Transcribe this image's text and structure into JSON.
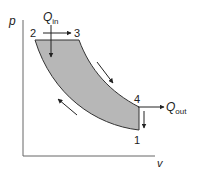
{
  "diagram": {
    "axes": {
      "y_label": "p",
      "x_label": "v"
    },
    "points": [
      {
        "id": "1",
        "label": "1"
      },
      {
        "id": "2",
        "label": "2"
      },
      {
        "id": "3",
        "label": "3"
      },
      {
        "id": "4",
        "label": "4"
      }
    ],
    "heat_in": {
      "symbol": "Q",
      "subscript": "in"
    },
    "heat_out": {
      "symbol": "Q",
      "subscript": "out"
    },
    "colors": {
      "fill": "#b7b7b7",
      "stroke": "#333333",
      "axis": "#555555"
    }
  }
}
